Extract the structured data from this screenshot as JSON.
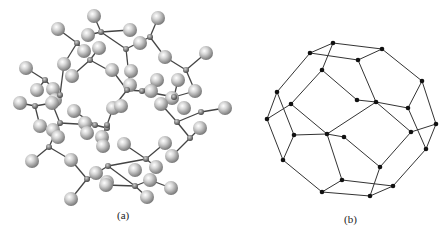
{
  "figure": {
    "panel_a": {
      "label": "(a)",
      "description": "ball-and-stick molecular model",
      "big_atoms": [
        [
          94,
          16
        ],
        [
          58,
          29
        ],
        [
          88,
          35
        ],
        [
          99,
          48
        ],
        [
          84,
          51
        ],
        [
          26,
          68
        ],
        [
          64,
          64
        ],
        [
          72,
          76
        ],
        [
          37,
          90
        ],
        [
          53,
          89
        ],
        [
          55,
          100
        ],
        [
          20,
          103
        ],
        [
          130,
          30
        ],
        [
          158,
          18
        ],
        [
          140,
          43
        ],
        [
          165,
          57
        ],
        [
          206,
          53
        ],
        [
          112,
          70
        ],
        [
          131,
          71
        ],
        [
          157,
          80
        ],
        [
          178,
          80
        ],
        [
          130,
          85
        ],
        [
          151,
          91
        ],
        [
          195,
          91
        ],
        [
          172,
          98
        ],
        [
          52,
          103
        ],
        [
          74,
          111
        ],
        [
          40,
          126
        ],
        [
          53,
          130
        ],
        [
          58,
          137
        ],
        [
          85,
          123
        ],
        [
          87,
          133
        ],
        [
          102,
          137
        ],
        [
          103,
          146
        ],
        [
          32,
          161
        ],
        [
          71,
          160
        ],
        [
          96,
          173
        ],
        [
          107,
          182
        ],
        [
          71,
          199
        ],
        [
          113,
          108
        ],
        [
          121,
          106
        ],
        [
          161,
          104
        ],
        [
          184,
          108
        ],
        [
          200,
          128
        ],
        [
          225,
          108
        ],
        [
          124,
          144
        ],
        [
          165,
          143
        ],
        [
          172,
          156
        ],
        [
          135,
          170
        ],
        [
          156,
          167
        ],
        [
          150,
          180
        ],
        [
          147,
          197
        ],
        [
          171,
          188
        ],
        [
          106,
          185
        ]
      ],
      "small_atoms": [
        [
          101,
          32
        ],
        [
          77,
          43
        ],
        [
          90,
          60
        ],
        [
          45,
          80
        ],
        [
          60,
          95
        ],
        [
          35,
          106
        ],
        [
          150,
          37
        ],
        [
          126,
          49
        ],
        [
          186,
          70
        ],
        [
          127,
          90
        ],
        [
          142,
          91
        ],
        [
          174,
          97
        ],
        [
          60,
          123
        ],
        [
          95,
          125
        ],
        [
          107,
          128
        ],
        [
          49,
          147
        ],
        [
          87,
          179
        ],
        [
          108,
          166
        ],
        [
          107,
          125
        ],
        [
          177,
          122
        ],
        [
          190,
          138
        ],
        [
          201,
          112
        ],
        [
          146,
          159
        ],
        [
          135,
          186
        ]
      ],
      "bonds": [
        [
          [
            101,
            32
          ],
          [
            94,
            16
          ]
        ],
        [
          [
            101,
            32
          ],
          [
            130,
            30
          ]
        ],
        [
          [
            101,
            32
          ],
          [
            88,
            35
          ]
        ],
        [
          [
            77,
            43
          ],
          [
            58,
            29
          ]
        ],
        [
          [
            77,
            43
          ],
          [
            84,
            51
          ]
        ],
        [
          [
            77,
            43
          ],
          [
            64,
            64
          ]
        ],
        [
          [
            90,
            60
          ],
          [
            99,
            48
          ]
        ],
        [
          [
            90,
            60
          ],
          [
            110,
            71
          ]
        ],
        [
          [
            90,
            60
          ],
          [
            72,
            76
          ]
        ],
        [
          [
            45,
            80
          ],
          [
            26,
            68
          ]
        ],
        [
          [
            45,
            80
          ],
          [
            60,
            95
          ]
        ],
        [
          [
            45,
            80
          ],
          [
            37,
            90
          ]
        ],
        [
          [
            60,
            95
          ],
          [
            64,
            64
          ]
        ],
        [
          [
            60,
            95
          ],
          [
            53,
            89
          ]
        ],
        [
          [
            35,
            106
          ],
          [
            20,
            103
          ]
        ],
        [
          [
            35,
            106
          ],
          [
            52,
            103
          ]
        ],
        [
          [
            35,
            106
          ],
          [
            40,
            126
          ]
        ],
        [
          [
            150,
            37
          ],
          [
            158,
            18
          ]
        ],
        [
          [
            150,
            37
          ],
          [
            126,
            49
          ]
        ],
        [
          [
            150,
            37
          ],
          [
            165,
            57
          ]
        ],
        [
          [
            126,
            49
          ],
          [
            101,
            32
          ]
        ],
        [
          [
            126,
            49
          ],
          [
            130,
            85
          ]
        ],
        [
          [
            186,
            70
          ],
          [
            165,
            57
          ]
        ],
        [
          [
            186,
            70
          ],
          [
            206,
            53
          ]
        ],
        [
          [
            186,
            70
          ],
          [
            195,
            91
          ]
        ],
        [
          [
            127,
            90
          ],
          [
            142,
            91
          ]
        ],
        [
          [
            127,
            90
          ],
          [
            112,
            70
          ]
        ],
        [
          [
            127,
            90
          ],
          [
            113,
            108
          ]
        ],
        [
          [
            142,
            91
          ],
          [
            157,
            80
          ]
        ],
        [
          [
            142,
            91
          ],
          [
            174,
            97
          ]
        ],
        [
          [
            174,
            97
          ],
          [
            178,
            80
          ]
        ],
        [
          [
            174,
            97
          ],
          [
            195,
            91
          ]
        ],
        [
          [
            60,
            123
          ],
          [
            52,
            103
          ]
        ],
        [
          [
            60,
            123
          ],
          [
            95,
            125
          ]
        ],
        [
          [
            60,
            123
          ],
          [
            49,
            147
          ]
        ],
        [
          [
            95,
            125
          ],
          [
            107,
            128
          ]
        ],
        [
          [
            95,
            125
          ],
          [
            74,
            111
          ]
        ],
        [
          [
            107,
            125
          ],
          [
            113,
            108
          ]
        ],
        [
          [
            107,
            125
          ],
          [
            102,
            137
          ]
        ],
        [
          [
            49,
            147
          ],
          [
            32,
            161
          ]
        ],
        [
          [
            49,
            147
          ],
          [
            71,
            160
          ]
        ],
        [
          [
            87,
            179
          ],
          [
            71,
            160
          ]
        ],
        [
          [
            87,
            179
          ],
          [
            71,
            199
          ]
        ],
        [
          [
            87,
            179
          ],
          [
            108,
            166
          ]
        ],
        [
          [
            108,
            166
          ],
          [
            146,
            159
          ]
        ],
        [
          [
            146,
            159
          ],
          [
            124,
            144
          ]
        ],
        [
          [
            146,
            159
          ],
          [
            165,
            143
          ]
        ],
        [
          [
            146,
            159
          ],
          [
            156,
            167
          ]
        ],
        [
          [
            177,
            122
          ],
          [
            161,
            104
          ]
        ],
        [
          [
            177,
            122
          ],
          [
            201,
            112
          ]
        ],
        [
          [
            177,
            122
          ],
          [
            190,
            138
          ]
        ],
        [
          [
            201,
            112
          ],
          [
            225,
            108
          ]
        ],
        [
          [
            190,
            138
          ],
          [
            172,
            156
          ]
        ],
        [
          [
            190,
            138
          ],
          [
            200,
            128
          ]
        ],
        [
          [
            135,
            186
          ],
          [
            108,
            166
          ]
        ],
        [
          [
            135,
            186
          ],
          [
            150,
            180
          ]
        ],
        [
          [
            135,
            186
          ],
          [
            147,
            197
          ]
        ],
        [
          [
            135,
            186
          ],
          [
            106,
            185
          ]
        ],
        [
          [
            150,
            180
          ],
          [
            171,
            188
          ]
        ]
      ]
    },
    "panel_b": {
      "label": "(b)",
      "description": "wireframe polyhedron graph",
      "nodes": [
        [
          333,
          43
        ],
        [
          382,
          49
        ],
        [
          310,
          53
        ],
        [
          358,
          60
        ],
        [
          322,
          70
        ],
        [
          422,
          81
        ],
        [
          277,
          92
        ],
        [
          357,
          100
        ],
        [
          376,
          102
        ],
        [
          291,
          104
        ],
        [
          408,
          108
        ],
        [
          267,
          119
        ],
        [
          436,
          124
        ],
        [
          411,
          132
        ],
        [
          294,
          135
        ],
        [
          327,
          134
        ],
        [
          344,
          137
        ],
        [
          426,
          149
        ],
        [
          283,
          160
        ],
        [
          380,
          167
        ],
        [
          342,
          180
        ],
        [
          393,
          186
        ],
        [
          322,
          192
        ],
        [
          370,
          196
        ]
      ],
      "edges": [
        [
          [
            333,
            43
          ],
          [
            382,
            49
          ]
        ],
        [
          [
            333,
            43
          ],
          [
            310,
            53
          ]
        ],
        [
          [
            333,
            43
          ],
          [
            322,
            70
          ]
        ],
        [
          [
            310,
            53
          ],
          [
            358,
            60
          ]
        ],
        [
          [
            382,
            49
          ],
          [
            358,
            60
          ]
        ],
        [
          [
            382,
            49
          ],
          [
            422,
            81
          ]
        ],
        [
          [
            358,
            60
          ],
          [
            376,
            102
          ]
        ],
        [
          [
            310,
            53
          ],
          [
            277,
            92
          ]
        ],
        [
          [
            322,
            70
          ],
          [
            291,
            104
          ]
        ],
        [
          [
            322,
            70
          ],
          [
            357,
            100
          ]
        ],
        [
          [
            357,
            100
          ],
          [
            376,
            102
          ]
        ],
        [
          [
            376,
            102
          ],
          [
            408,
            108
          ]
        ],
        [
          [
            376,
            102
          ],
          [
            327,
            134
          ]
        ],
        [
          [
            376,
            102
          ],
          [
            411,
            132
          ]
        ],
        [
          [
            422,
            81
          ],
          [
            408,
            108
          ]
        ],
        [
          [
            422,
            81
          ],
          [
            436,
            124
          ]
        ],
        [
          [
            408,
            108
          ],
          [
            426,
            149
          ]
        ],
        [
          [
            411,
            132
          ],
          [
            436,
            124
          ]
        ],
        [
          [
            411,
            132
          ],
          [
            380,
            167
          ]
        ],
        [
          [
            436,
            124
          ],
          [
            426,
            149
          ]
        ],
        [
          [
            426,
            149
          ],
          [
            393,
            186
          ]
        ],
        [
          [
            277,
            92
          ],
          [
            267,
            119
          ]
        ],
        [
          [
            277,
            92
          ],
          [
            294,
            135
          ]
        ],
        [
          [
            291,
            104
          ],
          [
            267,
            119
          ]
        ],
        [
          [
            291,
            104
          ],
          [
            327,
            134
          ]
        ],
        [
          [
            267,
            119
          ],
          [
            283,
            160
          ]
        ],
        [
          [
            294,
            135
          ],
          [
            327,
            134
          ]
        ],
        [
          [
            294,
            135
          ],
          [
            283,
            160
          ]
        ],
        [
          [
            327,
            134
          ],
          [
            344,
            137
          ]
        ],
        [
          [
            327,
            134
          ],
          [
            342,
            180
          ]
        ],
        [
          [
            344,
            137
          ],
          [
            380,
            167
          ]
        ],
        [
          [
            283,
            160
          ],
          [
            322,
            192
          ]
        ],
        [
          [
            342,
            180
          ],
          [
            322,
            192
          ]
        ],
        [
          [
            342,
            180
          ],
          [
            393,
            186
          ]
        ],
        [
          [
            380,
            167
          ],
          [
            370,
            196
          ]
        ],
        [
          [
            322,
            192
          ],
          [
            370,
            196
          ]
        ],
        [
          [
            370,
            196
          ],
          [
            393,
            186
          ]
        ]
      ]
    }
  },
  "colors": {
    "background": "#ffffff",
    "atom_light": "#e8e8e8",
    "atom_dark": "#7a7a7a",
    "bond": "#444444",
    "node": "#111111",
    "edge": "#333333"
  }
}
